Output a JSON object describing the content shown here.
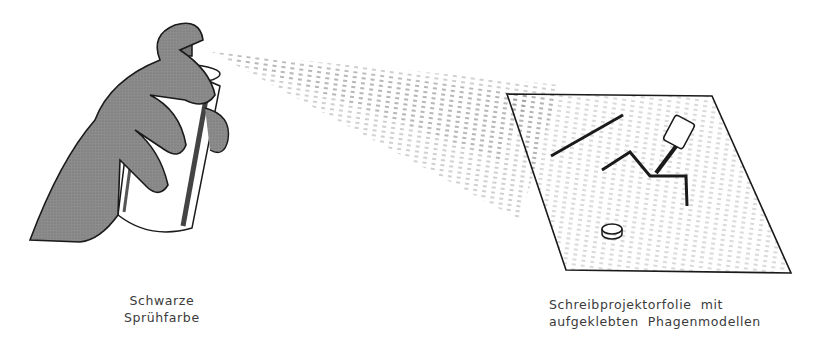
{
  "figure": {
    "labels": {
      "spray_paint": [
        "Schwarze",
        "Sprühfarbe"
      ],
      "transparency": [
        "Schreibprojektorfolie  mit",
        "aufgeklebten  Phagenmodellen"
      ]
    },
    "elements": {
      "hand": "hand-holding-can",
      "spray_can": "spray-can",
      "spray_mist": "spray-cone",
      "sheet": "overhead-transparency-sheet",
      "phage_models": [
        "tail-fiber-rod",
        "phage-with-head-and-bent-legs",
        "base-plate-disc"
      ]
    },
    "colors": {
      "ink": "#1a1a1a",
      "hand_fill": "#8a8a8a",
      "background": "#ffffff"
    }
  }
}
